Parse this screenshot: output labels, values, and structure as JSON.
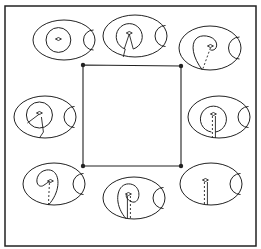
{
  "figure": {
    "stroke_color": "#222222",
    "background": "#ffffff",
    "frame": {
      "x": 5,
      "y": 6,
      "w": 251,
      "h": 240
    },
    "square": {
      "corners": [
        [
          83,
          65
        ],
        [
          181,
          66
        ],
        [
          181,
          166
        ],
        [
          83,
          166
        ]
      ],
      "dot_radius": 2.2
    },
    "panels": [
      {
        "id": "top-left",
        "cx": 64,
        "cy": 40,
        "rx": 31,
        "ry": 20,
        "variant": "concentric"
      },
      {
        "id": "top-center",
        "cx": 135,
        "cy": 36,
        "rx": 32,
        "ry": 21,
        "variant": "loop-open"
      },
      {
        "id": "top-right",
        "cx": 210,
        "cy": 48,
        "rx": 31,
        "ry": 22,
        "variant": "teardrop"
      },
      {
        "id": "middle-left",
        "cx": 45,
        "cy": 117,
        "rx": 31,
        "ry": 21,
        "variant": "loop-slash"
      },
      {
        "id": "middle-right",
        "cx": 219,
        "cy": 117,
        "rx": 31,
        "ry": 21,
        "variant": "loop-stem"
      },
      {
        "id": "bottom-left",
        "cx": 54,
        "cy": 184,
        "rx": 31,
        "ry": 21,
        "variant": "spiral"
      },
      {
        "id": "bottom-center",
        "cx": 134,
        "cy": 198,
        "rx": 31,
        "ry": 21,
        "variant": "spiral-stem"
      },
      {
        "id": "bottom-right",
        "cx": 211,
        "cy": 184,
        "rx": 31,
        "ry": 21,
        "variant": "stem-only"
      }
    ]
  }
}
